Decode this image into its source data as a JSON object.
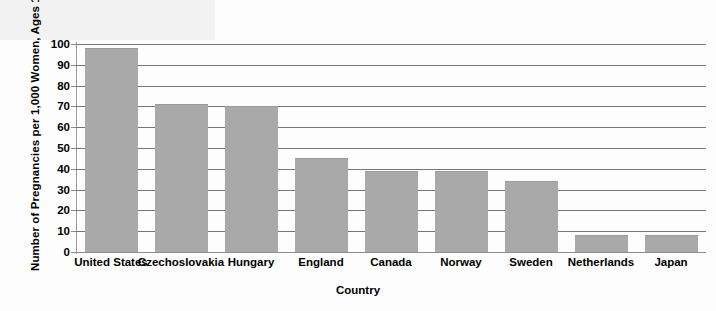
{
  "chart_data": {
    "type": "bar",
    "title": "",
    "xlabel": "Country",
    "ylabel": "Number of Pregnancies per 1,000 Women, Ages 15–19",
    "categories": [
      "United States",
      "Czechoslovakia",
      "Hungary",
      "England",
      "Canada",
      "Norway",
      "Sweden",
      "Netherlands",
      "Japan"
    ],
    "values": [
      98,
      71,
      70,
      45,
      39,
      39,
      34,
      8,
      8
    ],
    "ylim": [
      0,
      100
    ],
    "yticks": [
      0,
      10,
      20,
      30,
      40,
      50,
      60,
      70,
      80,
      90,
      100
    ],
    "ytick_labels": [
      "0",
      "10",
      "20",
      "30",
      "40",
      "50",
      "60",
      "70",
      "80",
      "90",
      "100"
    ],
    "grid": true,
    "legend": false,
    "legend_position": "none",
    "bar_color": "#a9a9a9",
    "gridline_color": "#767676",
    "axis_color": "#9a9a9a",
    "background_color": "#fdfdfd",
    "text_color": "#000000"
  }
}
